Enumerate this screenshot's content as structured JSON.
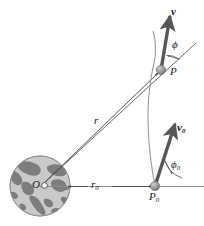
{
  "figure": {
    "caption": "",
    "colors": {
      "line": "#4a4a4a",
      "thin_line": "#8c8c8c",
      "vector": "#575757",
      "marker": "#9b9b9b",
      "marker_edge": "#6e6e6e",
      "ocean": "#c9c9c9",
      "land": "#7d7d7d",
      "globe_edge": "#8f8f8f",
      "text": "#1a1a1a",
      "caption_text": "#e2e2e2"
    },
    "labels": {
      "velocity": "v",
      "velocity_initial_base": "v",
      "velocity_initial_sub": "0",
      "point_p": "P",
      "point_p0_base": "P",
      "point_p0_sub": "0",
      "origin": "O",
      "radius": "r",
      "radius_initial_base": "r",
      "radius_initial_sub": "0",
      "angle_phi": "ϕ",
      "angle_phi0_base": "ϕ",
      "angle_phi0_sub": "0"
    }
  }
}
